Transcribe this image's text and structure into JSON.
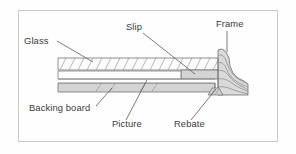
{
  "figure": {
    "background_color": "#fefefe",
    "border_color": "#c9c9c9",
    "line_color": "#6f6f6f",
    "label_color": "#3b3b3b",
    "fill_gray": "#d4d4d4",
    "fill_light": "#e9e9e9",
    "fill_white": "#fbfbfb"
  },
  "labels": [
    {
      "id": "glass",
      "text": "Glass",
      "x": 24,
      "y": 44,
      "anchor": "start"
    },
    {
      "id": "slip",
      "text": "Slip",
      "x": 126,
      "y": 30,
      "anchor": "start"
    },
    {
      "id": "frame",
      "text": "Frame",
      "x": 216,
      "y": 27,
      "anchor": "start"
    },
    {
      "id": "backing-board",
      "text": "Backing board",
      "x": 29,
      "y": 111,
      "anchor": "start"
    },
    {
      "id": "picture",
      "text": "Picture",
      "x": 112,
      "y": 127,
      "anchor": "start"
    },
    {
      "id": "rebate",
      "text": "Rebate",
      "x": 174,
      "y": 127,
      "anchor": "start"
    }
  ],
  "leaders": [
    {
      "id": "glass-leader",
      "from": "Glass",
      "points": "57,41 93,62"
    },
    {
      "id": "slip-leader",
      "from": "Slip",
      "points": "143,33 195,74"
    },
    {
      "id": "frame-leader",
      "from": "Frame",
      "points": "227,31 227,52"
    },
    {
      "id": "backing-board-leader",
      "from": "Backing board",
      "points": "96,106 112,88"
    },
    {
      "id": "picture-leader",
      "from": "Picture",
      "points": "126,120 147,80"
    },
    {
      "id": "rebate-leader",
      "from": "Rebate",
      "points": "191,120 216,89"
    }
  ],
  "parts": [
    {
      "id": "glass",
      "name": "Glass",
      "description": "Hatched band, upper layer"
    },
    {
      "id": "slip",
      "name": "Slip",
      "description": "Solid grey block at right end under glass"
    },
    {
      "id": "picture",
      "name": "Picture",
      "description": "Thin white layer below glass"
    },
    {
      "id": "backing-board",
      "name": "Backing board",
      "description": "Grey band, lowest layer"
    },
    {
      "id": "frame",
      "name": "Frame",
      "description": "Wood-grain moulding profile at right"
    },
    {
      "id": "rebate",
      "name": "Rebate",
      "description": "Notch in frame holding the assembly"
    }
  ]
}
